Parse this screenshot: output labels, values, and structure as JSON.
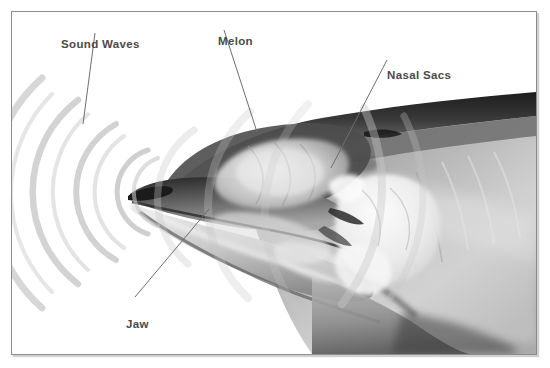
{
  "figure": {
    "background_color": "#ffffff",
    "frame_color": "#8d8d8d",
    "label_color": "#4a4a4a",
    "wave_color": "#c9c9c9",
    "leader_color": "#6e6e6e"
  },
  "labels": [
    {
      "id": "sound-waves",
      "text": "Sound Waves",
      "leader": {
        "x1": 93,
        "y1": 31,
        "x2": 82,
        "y2": 122
      }
    },
    {
      "id": "melon",
      "text": "Melon",
      "leader": {
        "x1": 222,
        "y1": 28,
        "x2": 255,
        "y2": 130
      }
    },
    {
      "id": "nasal-sacs",
      "text": "Nasal Sacs",
      "leader": {
        "x1": 385,
        "y1": 58,
        "x2": 329,
        "y2": 166
      }
    },
    {
      "id": "jaw",
      "text": "Jaw",
      "leader": {
        "x1": 207,
        "y1": 207,
        "x2": 133,
        "y2": 295
      }
    }
  ],
  "sound_waves": {
    "description": "Concentric arcs radiating forward from the tip of the rostrum",
    "origin": {
      "x": 120,
      "y": 178
    },
    "arc_count": 6,
    "radii": [
      40,
      78,
      116,
      154,
      192,
      230
    ],
    "color": "#c9c9c9"
  },
  "anatomy": {
    "melon": "Fatty lens in the forehead that focuses outgoing clicks",
    "nasal_sacs": "Air sacs below the blowhole that generate the clicks",
    "jaw": "Lower jaw that receives returning echoes"
  }
}
